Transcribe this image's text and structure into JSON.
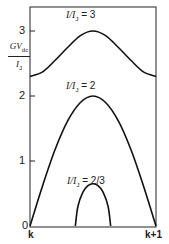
{
  "chart_data": {
    "type": "line",
    "title": "",
    "xlabel": "",
    "ylabel": "GV_dc / I_J",
    "ylabel_parts": {
      "num": "GV",
      "num_sub": "dc",
      "den": "I",
      "den_sub": "J"
    },
    "x_ticks": [
      "k",
      "k+1"
    ],
    "y_ticks": [
      "0",
      "1",
      "2",
      "3"
    ],
    "xlim": [
      0,
      1
    ],
    "ylim": [
      0,
      3.3
    ],
    "grid": false,
    "legend": "inline annotations",
    "series": [
      {
        "name": "I/I_J = 3",
        "label": "I/I",
        "sub": "J",
        "eq": " = 3",
        "x": [
          0,
          0.1,
          0.2,
          0.3,
          0.4,
          0.5,
          0.6,
          0.7,
          0.8,
          0.9,
          1.0
        ],
        "values": [
          2.3,
          2.37,
          2.55,
          2.75,
          2.93,
          3.0,
          2.93,
          2.75,
          2.55,
          2.37,
          2.3
        ]
      },
      {
        "name": "I/I_J = 2",
        "label": "I/I",
        "sub": "J",
        "eq": " = 2",
        "x": [
          0,
          0.1,
          0.2,
          0.3,
          0.4,
          0.5,
          0.6,
          0.7,
          0.8,
          0.9,
          1.0
        ],
        "values": [
          0,
          0.62,
          1.18,
          1.62,
          1.9,
          2.0,
          1.9,
          1.62,
          1.18,
          0.62,
          0
        ]
      },
      {
        "name": "I/I_J = 2/3",
        "label": "I/I",
        "sub": "J",
        "eq": " = 2/3",
        "x": [
          0.36,
          0.38,
          0.42,
          0.46,
          0.5,
          0.54,
          0.58,
          0.62,
          0.64
        ],
        "values": [
          0,
          0.3,
          0.52,
          0.62,
          0.65,
          0.62,
          0.52,
          0.3,
          0
        ]
      }
    ]
  }
}
